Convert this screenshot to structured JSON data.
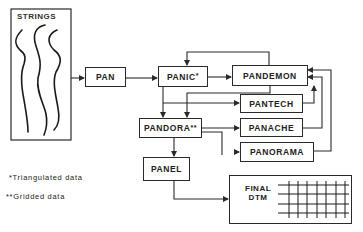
{
  "diagram": {
    "nodes": {
      "strings": {
        "label": "STRINGS"
      },
      "pan": {
        "label": "PAN"
      },
      "panic": {
        "label": "PANIC",
        "marker": "*"
      },
      "pandemon": {
        "label": "PANDEMON"
      },
      "pantech": {
        "label": "PANTECH"
      },
      "pandora": {
        "label": "PANDORA",
        "marker": "**"
      },
      "panache": {
        "label": "PANACHE"
      },
      "panorama": {
        "label": "PANORAMA"
      },
      "panel": {
        "label": "PANEL"
      },
      "final_dtm": {
        "label_line1": "FINAL",
        "label_line2": "DTM"
      }
    },
    "edges": [
      {
        "from": "STRINGS",
        "to": "PAN"
      },
      {
        "from": "PAN",
        "to": "PANIC"
      },
      {
        "from": "PANIC",
        "to": "PANDEMON"
      },
      {
        "from": "PANDEMON",
        "to": "PANIC"
      },
      {
        "from": "PANIC",
        "to": "PANDORA"
      },
      {
        "from": "PANDEMON",
        "to": "PANDORA"
      },
      {
        "from": "PANIC",
        "to": "PANTECH"
      },
      {
        "from": "PANDORA",
        "to": "PANACHE"
      },
      {
        "from": "PANDORA",
        "to": "PANORAMA"
      },
      {
        "from": "PANTECH",
        "to": "PANDEMON"
      },
      {
        "from": "PANACHE",
        "to": "PANDEMON"
      },
      {
        "from": "PANORAMA",
        "to": "PANDEMON"
      },
      {
        "from": "PANDORA",
        "to": "PANEL"
      },
      {
        "from": "PANEL",
        "to": "FINAL DTM"
      }
    ]
  },
  "legend": {
    "single_star": "*Triangulated data",
    "double_star": "**Gridded data"
  },
  "colors": {
    "line": "#2a2a2a",
    "background": "#ffffff"
  }
}
